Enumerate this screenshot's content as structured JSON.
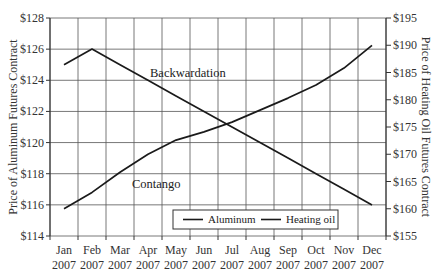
{
  "chart_data": {
    "type": "line",
    "title": "",
    "categories": [
      "Jan 2007",
      "Feb 2007",
      "Mar 2007",
      "Apr 2007",
      "May 2007",
      "Jun 2007",
      "Jul 2007",
      "Aug 2007",
      "Sep 2007",
      "Oct 2007",
      "Nov 2007",
      "Dec 2007"
    ],
    "x_tick_labels": [
      {
        "month": "Jan",
        "year": "2007"
      },
      {
        "month": "Feb",
        "year": "2007"
      },
      {
        "month": "Mar",
        "year": "2007"
      },
      {
        "month": "Apr",
        "year": "2007"
      },
      {
        "month": "May",
        "year": "2007"
      },
      {
        "month": "Jun",
        "year": "2007"
      },
      {
        "month": "Jul",
        "year": "2007"
      },
      {
        "month": "Aug",
        "year": "2007"
      },
      {
        "month": "Sep",
        "year": "2007"
      },
      {
        "month": "Oct",
        "year": "2007"
      },
      {
        "month": "Nov",
        "year": "2007"
      },
      {
        "month": "Dec",
        "year": "2007"
      }
    ],
    "series": [
      {
        "name": "Aluminum",
        "axis": "left",
        "values": [
          125,
          126,
          125,
          124,
          123,
          122,
          121,
          120,
          119,
          118,
          117,
          116
        ]
      },
      {
        "name": "Heating oil",
        "axis": "right",
        "values": [
          160,
          163,
          166.7,
          170,
          172.6,
          174.1,
          175.9,
          178.1,
          180.3,
          182.7,
          185.8,
          190
        ]
      }
    ],
    "ylabel_left": "Price of Aluminum Futures Contract",
    "ylabel_right": "Price of Heating Oil Futures Contract",
    "xlabel": "",
    "ylim_left": [
      114,
      128
    ],
    "ylim_right": [
      155,
      195
    ],
    "y_ticks_left": [
      "$114",
      "$116",
      "$118",
      "$120",
      "$122",
      "$124",
      "$126",
      "$128"
    ],
    "y_ticks_right": [
      "$155",
      "$160",
      "$165",
      "$170",
      "$175",
      "$180",
      "$185",
      "$190",
      "$195"
    ],
    "annotations": [
      {
        "text": "Backwardation",
        "near": "Aluminum"
      },
      {
        "text": "Contango",
        "near": "Heating oil"
      }
    ],
    "grid": true,
    "legend_position": "bottom-center inside plot",
    "line_color": "#1a1a1a"
  },
  "legend": {
    "items": [
      {
        "label": "Aluminum"
      },
      {
        "label": "Heating oil"
      }
    ]
  },
  "annotations": {
    "backwardation": "Backwardation",
    "contango": "Contango"
  },
  "axes": {
    "left_label": "Price of Aluminum Futures Contract",
    "right_label": "Price of Heating Oil Futures Contract"
  }
}
